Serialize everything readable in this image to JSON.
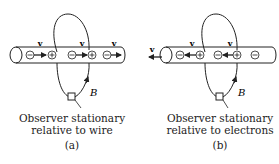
{
  "panels": [
    {
      "id": "a",
      "caption_line1": "Observer stationary",
      "caption_line2": "relative to wire",
      "label": "(a)",
      "velocity_label": "v",
      "field_label": "B",
      "charges": [
        "−",
        "+",
        "−",
        "+",
        "−"
      ],
      "electron_motion": "right"
    },
    {
      "id": "b",
      "caption_line1": "Observer stationary",
      "caption_line2": "relative to electrons",
      "label": "(b)",
      "velocity_label": "v",
      "field_label": "B",
      "charges": [
        "−",
        "+",
        "−",
        "+",
        "−"
      ],
      "ion_motion": "left"
    }
  ]
}
